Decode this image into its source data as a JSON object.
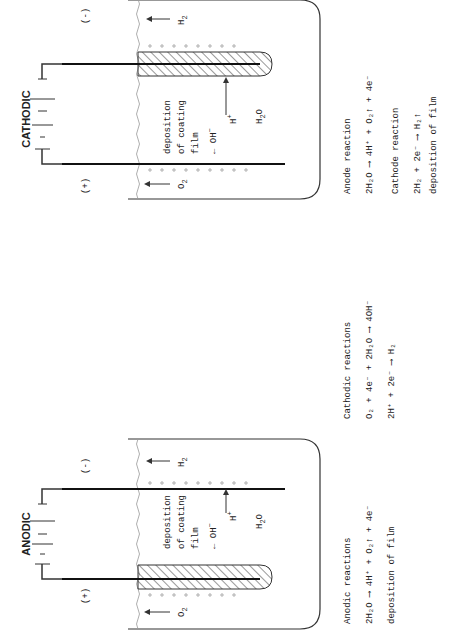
{
  "anodic": {
    "title": "ANODIC",
    "plus": "(+)",
    "minus": "(-)",
    "o2": "O",
    "o2_sub": "2",
    "h2": "H",
    "h2_sub": "2",
    "deposition_line1": "deposition",
    "deposition_line2": "of coating",
    "deposition_line3": "film",
    "oh": "OH",
    "oh_sup": "−",
    "h_plus": "H",
    "h_plus_sup": "+",
    "water": "H",
    "water_sub": "2",
    "water_o": "O",
    "reactions_title": "Anodic reactions",
    "reaction1": "2H₂O ⟶ 4H⁺ + O₂↑ + 4e⁻",
    "reaction2": "deposition of film",
    "cathodic_reactions_title": "Cathodic reactions",
    "cathodic_reaction1": "O₂ + 4e⁻ + 2H₂O ⟶ 4OH⁻",
    "cathodic_reaction2": "2H⁺ + 2e⁻ ⟶ H₂"
  },
  "cathodic": {
    "title": "CATHODIC",
    "plus": "(+)",
    "minus": "(-)",
    "o2": "O",
    "o2_sub": "2",
    "h2": "H",
    "h2_sub": "2",
    "deposition_line1": "deposition",
    "deposition_line2": "of coating",
    "deposition_line3": "film",
    "oh": "OH",
    "oh_sup": "−",
    "h_plus": "H",
    "h_plus_sup": "+",
    "water": "H",
    "water_sub": "2",
    "water_o": "O",
    "anode_reaction_title": "Anode reaction",
    "anode_reaction1": "2H₂O ⟶ 4H⁺ + O₂↑ + 4e⁻",
    "cathode_reaction_title": "Cathode reaction",
    "cathode_reaction1": "2H₂ + 2e⁻ ⟶ H₂↑",
    "cathode_reaction2": "deposition of film"
  }
}
